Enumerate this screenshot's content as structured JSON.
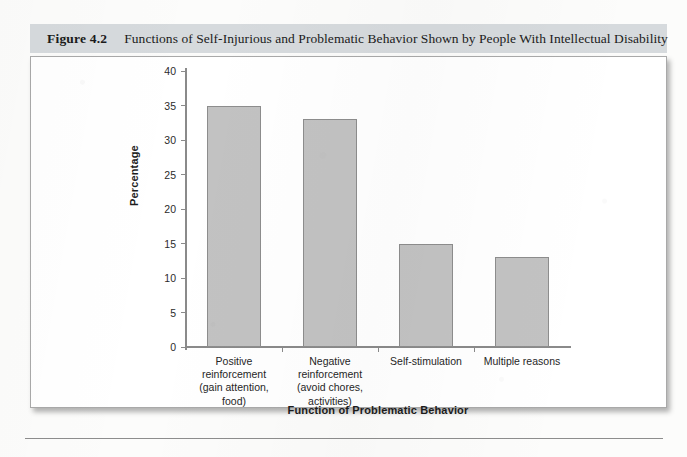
{
  "figure": {
    "number_label": "Figure 4.2",
    "caption": "Functions of Self-Injurious and Problematic Behavior Shown by People With Intellectual Disability"
  },
  "colors": {
    "caption_band": "#d6dadd",
    "bar_fill": "#c2c2c2",
    "bar_stroke": "#8d8d8d",
    "axis": "#8a8a8a",
    "text": "#1c1c1c",
    "frame_border": "#a9a9a9"
  },
  "chart_data": {
    "type": "bar",
    "title": "Functions of Self-Injurious and Problematic Behavior Shown by People With Intellectual Disability",
    "xlabel": "Function of Problematic Behavior",
    "ylabel": "Percentage",
    "categories": [
      "Positive reinforcement (gain attention, food)",
      "Negative reinforcement (avoid chores, activities)",
      "Self-stimulation",
      "Multiple reasons"
    ],
    "category_lines": [
      [
        "Positive",
        "reinforcement",
        "(gain attention,",
        "food)"
      ],
      [
        "Negative",
        "reinforcement",
        "(avoid chores,",
        "activities)"
      ],
      [
        "Self-stimulation"
      ],
      [
        "Multiple reasons"
      ]
    ],
    "values": [
      35,
      33,
      15,
      13
    ],
    "ylim": [
      0,
      40
    ],
    "yticks": [
      40,
      35,
      30,
      25,
      20,
      15,
      10,
      5,
      0
    ],
    "grid": false,
    "legend": null
  }
}
